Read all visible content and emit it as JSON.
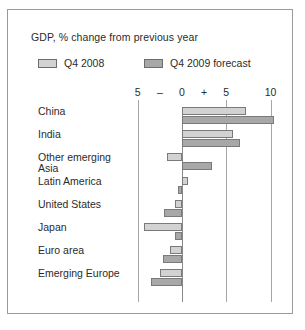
{
  "chart_data": {
    "type": "bar",
    "orientation": "horizontal",
    "title": "GDP, % change from previous year",
    "xlabel": "",
    "ylabel": "",
    "categories": [
      "China",
      "India",
      "Other emerging\nAsia",
      "Latin America",
      "United States",
      "Japan",
      "Euro area",
      "Emerging Europe"
    ],
    "series": [
      {
        "name": "Q4 2008",
        "color": "#d2d2d2",
        "values": [
          7.2,
          5.8,
          -1.7,
          0.7,
          -0.8,
          -4.3,
          -1.3,
          -2.5
        ]
      },
      {
        "name": "Q4 2009 forecast",
        "color": "#a8a8a8",
        "values": [
          10.4,
          6.6,
          3.4,
          -0.5,
          -2.0,
          -0.8,
          -2.2,
          -3.5
        ]
      }
    ],
    "xlim": [
      -5.8,
      11.2
    ],
    "xticks": [
      -5,
      0,
      5,
      10
    ],
    "xtick_labels": [
      "5",
      "0",
      "5",
      "10"
    ],
    "sign_markers": [
      {
        "label": "–",
        "value": -2.5
      },
      {
        "label": "+",
        "value": 2.5
      }
    ],
    "grid": true,
    "grid_axis": "x",
    "legend_position": "top-left"
  },
  "figure": {
    "border_color": "#9a9a9a",
    "background": "#ffffff"
  }
}
